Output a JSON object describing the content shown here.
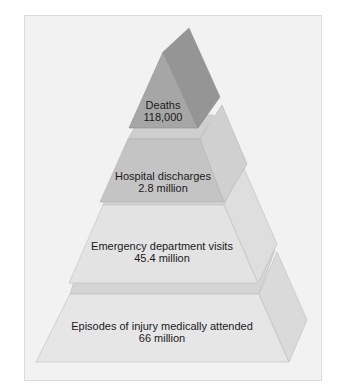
{
  "diagram": {
    "type": "pyramid",
    "levels": [
      {
        "title": "Deaths",
        "value": "118,000",
        "front": "#a6a6a6",
        "side": "#959595",
        "top": "#b8b8b8"
      },
      {
        "title": "Hospital discharges",
        "value": "2.8 million",
        "front": "#c4c4c4",
        "side": "#d0d0d0",
        "top": "#cfcfcf"
      },
      {
        "title": "Emergency department visits",
        "value": "45.4 million",
        "front": "#e3e3e3",
        "side": "#dedede",
        "top": "#d6d6d6"
      },
      {
        "title": "Episodes of injury medically attended",
        "value": "66 million",
        "front": "#e6e6e6",
        "side": "#dadada",
        "top": "#d2d2d2"
      }
    ]
  },
  "colors": {
    "panel_bg": "#f2f2f2",
    "panel_border": "#dcdcdc",
    "stroke": "#b5b5b5"
  }
}
